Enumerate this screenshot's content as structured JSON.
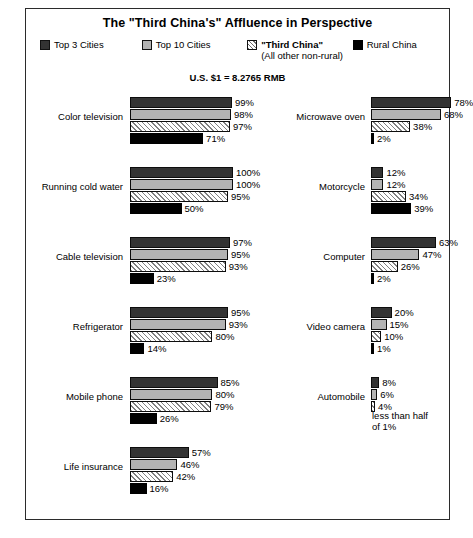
{
  "header": {
    "title": "The \"Third China's\" Affluence in Perspective",
    "rate_note": "U.S. $1 = 8.2765 RMB"
  },
  "legend": [
    {
      "label": "Top 3 Cities",
      "sublabel": "",
      "swatch": "dark-gray-swatch",
      "bold": false
    },
    {
      "label": "Top 10 Cities",
      "sublabel": "",
      "swatch": "light-gray-swatch",
      "bold": false
    },
    {
      "label": "\"Third China\"",
      "sublabel": "(All other non-rural)",
      "swatch": "hatched-swatch",
      "bold": true
    },
    {
      "label": "Rural China",
      "sublabel": "",
      "swatch": "black-swatch",
      "bold": false
    }
  ],
  "chart_data": {
    "type": "bar",
    "title": "The \"Third China's\" Affluence in Perspective",
    "subtitle": "U.S. $1 = 8.2765 RMB",
    "orientation": "horizontal",
    "xlabel": "",
    "ylabel": "",
    "xlim": [
      0,
      100
    ],
    "grid": false,
    "legend_position": "top",
    "series": [
      {
        "name": "Top 3 Cities",
        "color": "#333333"
      },
      {
        "name": "Top 10 Cities",
        "color": "#b3b3b3"
      },
      {
        "name": "\"Third China\" (All other non-rural)",
        "color": "#ffffff"
      },
      {
        "name": "Rural China",
        "color": "#000000"
      }
    ],
    "categories": [
      "Color television",
      "Running cold water",
      "Cable television",
      "Refrigerator",
      "Mobile phone",
      "Life insurance",
      "Microwave oven",
      "Motorcycle",
      "Computer",
      "Video camera",
      "Automobile"
    ],
    "values": {
      "Color television": [
        99,
        98,
        97,
        71
      ],
      "Running cold water": [
        100,
        100,
        95,
        50
      ],
      "Cable television": [
        97,
        95,
        93,
        23
      ],
      "Refrigerator": [
        95,
        93,
        80,
        14
      ],
      "Mobile phone": [
        85,
        80,
        79,
        26
      ],
      "Life insurance": [
        57,
        46,
        42,
        16
      ],
      "Microwave oven": [
        78,
        68,
        38,
        2
      ],
      "Motorcycle": [
        12,
        12,
        34,
        39
      ],
      "Computer": [
        63,
        47,
        26,
        2
      ],
      "Video camera": [
        20,
        15,
        10,
        1
      ],
      "Automobile": [
        8,
        6,
        4,
        0.4
      ]
    }
  },
  "columns": {
    "left": [
      {
        "category": "Color television",
        "bars": [
          {
            "series": "Top 3 Cities",
            "value": 99,
            "label": "99%"
          },
          {
            "series": "Top 10 Cities",
            "value": 98,
            "label": "98%"
          },
          {
            "series": "Third China",
            "value": 97,
            "label": "97%"
          },
          {
            "series": "Rural China",
            "value": 71,
            "label": "71%"
          }
        ]
      },
      {
        "category": "Running cold water",
        "bars": [
          {
            "series": "Top 3 Cities",
            "value": 100,
            "label": "100%"
          },
          {
            "series": "Top 10 Cities",
            "value": 100,
            "label": "100%"
          },
          {
            "series": "Third China",
            "value": 95,
            "label": "95%"
          },
          {
            "series": "Rural China",
            "value": 50,
            "label": "50%"
          }
        ]
      },
      {
        "category": "Cable television",
        "bars": [
          {
            "series": "Top 3 Cities",
            "value": 97,
            "label": "97%"
          },
          {
            "series": "Top 10 Cities",
            "value": 95,
            "label": "95%"
          },
          {
            "series": "Third China",
            "value": 93,
            "label": "93%"
          },
          {
            "series": "Rural China",
            "value": 23,
            "label": "23%"
          }
        ]
      },
      {
        "category": "Refrigerator",
        "bars": [
          {
            "series": "Top 3 Cities",
            "value": 95,
            "label": "95%"
          },
          {
            "series": "Top 10 Cities",
            "value": 93,
            "label": "93%"
          },
          {
            "series": "Third China",
            "value": 80,
            "label": "80%"
          },
          {
            "series": "Rural China",
            "value": 14,
            "label": "14%"
          }
        ]
      },
      {
        "category": "Mobile phone",
        "bars": [
          {
            "series": "Top 3 Cities",
            "value": 85,
            "label": "85%"
          },
          {
            "series": "Top 10 Cities",
            "value": 80,
            "label": "80%"
          },
          {
            "series": "Third China",
            "value": 79,
            "label": "79%"
          },
          {
            "series": "Rural China",
            "value": 26,
            "label": "26%"
          }
        ]
      },
      {
        "category": "Life insurance",
        "bars": [
          {
            "series": "Top 3 Cities",
            "value": 57,
            "label": "57%"
          },
          {
            "series": "Top 10 Cities",
            "value": 46,
            "label": "46%"
          },
          {
            "series": "Third China",
            "value": 42,
            "label": "42%"
          },
          {
            "series": "Rural China",
            "value": 16,
            "label": "16%"
          }
        ]
      }
    ],
    "right": [
      {
        "category": "Microwave oven",
        "bars": [
          {
            "series": "Top 3 Cities",
            "value": 78,
            "label": "78%"
          },
          {
            "series": "Top 10 Cities",
            "value": 68,
            "label": "68%"
          },
          {
            "series": "Third China",
            "value": 38,
            "label": "38%"
          },
          {
            "series": "Rural China",
            "value": 2,
            "label": "2%"
          }
        ]
      },
      {
        "category": "Motorcycle",
        "bars": [
          {
            "series": "Top 3 Cities",
            "value": 12,
            "label": "12%"
          },
          {
            "series": "Top 10 Cities",
            "value": 12,
            "label": "12%"
          },
          {
            "series": "Third China",
            "value": 34,
            "label": "34%"
          },
          {
            "series": "Rural China",
            "value": 39,
            "label": "39%"
          }
        ]
      },
      {
        "category": "Computer",
        "bars": [
          {
            "series": "Top 3 Cities",
            "value": 63,
            "label": "63%"
          },
          {
            "series": "Top 10 Cities",
            "value": 47,
            "label": "47%"
          },
          {
            "series": "Third China",
            "value": 26,
            "label": "26%"
          },
          {
            "series": "Rural China",
            "value": 2,
            "label": "2%"
          }
        ]
      },
      {
        "category": "Video camera",
        "bars": [
          {
            "series": "Top 3 Cities",
            "value": 20,
            "label": "20%"
          },
          {
            "series": "Top 10 Cities",
            "value": 15,
            "label": "15%"
          },
          {
            "series": "Third China",
            "value": 10,
            "label": "10%"
          },
          {
            "series": "Rural China",
            "value": 1,
            "label": "1%"
          }
        ]
      },
      {
        "category": "Automobile",
        "bars": [
          {
            "series": "Top 3 Cities",
            "value": 8,
            "label": "8%"
          },
          {
            "series": "Top 10 Cities",
            "value": 6,
            "label": "6%"
          },
          {
            "series": "Third China",
            "value": 4,
            "label": "4%"
          },
          {
            "series": "Rural China",
            "value": 0,
            "label": "less than half\nof 1%"
          }
        ]
      }
    ]
  }
}
